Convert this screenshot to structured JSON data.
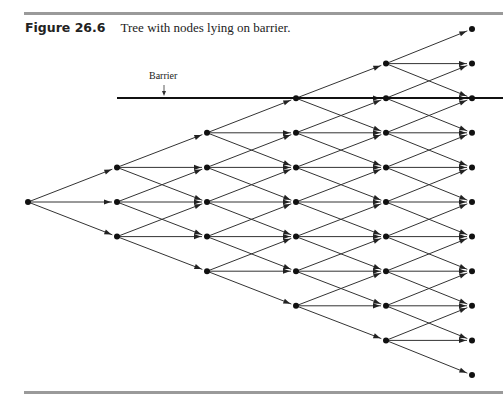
{
  "figure": {
    "label": "Figure 26.6",
    "caption": "Tree with nodes lying on barrier.",
    "barrier_label": "Barrier"
  },
  "tree": {
    "type": "trinomial",
    "levels": 6,
    "level_x": [
      28,
      117,
      207,
      296,
      386,
      472
    ],
    "center_y": 202,
    "spacing_y": 34.6,
    "barrier": {
      "x_start": 117,
      "x_end": 503,
      "y": 98,
      "label_x": 149,
      "label_y": 70,
      "arrow_x": 164
    }
  },
  "colors": {
    "line": "#333333",
    "node": "#111111",
    "barrier": "#111111",
    "rule": "#9a9a9a"
  }
}
